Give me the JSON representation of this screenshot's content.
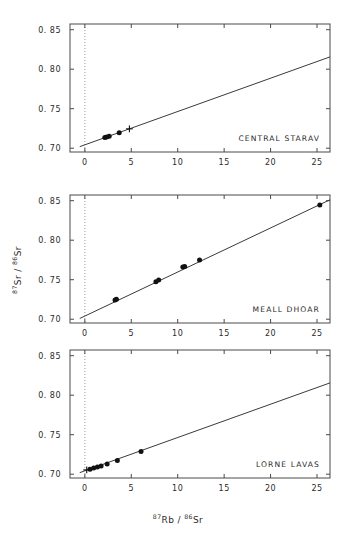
{
  "figure": {
    "axis_labels": {
      "x_sup1": "87",
      "x_base1": "Rb",
      "x_sep": " / ",
      "x_sup2": "86",
      "x_base2": "Sr",
      "y_sup1": "87",
      "y_base1": "Sr",
      "y_sep": " / ",
      "y_sup2": "86",
      "y_base2": "Sr"
    },
    "colors": {
      "frame": "#4a4a4a",
      "marker": "#111111",
      "line": "#3a3a3a",
      "reference_dotted": "#9a9a9a",
      "text": "#2b2b2b",
      "background": "#ffffff"
    }
  },
  "chart_data": [
    {
      "type": "scatter",
      "title": "CENTRAL STARAV",
      "xlabel": "87Rb / 86Sr",
      "ylabel": "87Sr / 86Sr",
      "xlim": [
        -1.6,
        26.4
      ],
      "ylim": [
        0.6952,
        0.8572
      ],
      "xticks": [
        0,
        5,
        10,
        15,
        20,
        25
      ],
      "yticks": [
        0.7,
        0.75,
        0.8,
        0.85
      ],
      "xtick_labels": [
        "0",
        "5",
        "10",
        "15",
        "20",
        "25"
      ],
      "ytick_labels": [
        "0. 70",
        "0. 75",
        "0. 80",
        "0. 85"
      ],
      "grid": false,
      "legend": "none",
      "reference_line_x": 0,
      "points": [
        {
          "x": 2.15,
          "y": 0.7137,
          "marker": "filled-circle"
        },
        {
          "x": 2.35,
          "y": 0.7142,
          "marker": "filled-circle"
        },
        {
          "x": 2.62,
          "y": 0.7152,
          "marker": "filled-circle"
        },
        {
          "x": 3.7,
          "y": 0.7196,
          "marker": "filled-circle"
        },
        {
          "x": 4.8,
          "y": 0.7245,
          "marker": "cross"
        }
      ],
      "fit_line": {
        "intercept": 0.7043,
        "slope": 0.004215,
        "x_from": -0.55,
        "x_to": 26.4
      }
    },
    {
      "type": "scatter",
      "title": "MEALL DHOAR",
      "xlabel": "87Rb / 86Sr",
      "ylabel": "87Sr / 86Sr",
      "xlim": [
        -1.6,
        26.4
      ],
      "ylim": [
        0.6952,
        0.8572
      ],
      "xticks": [
        0,
        5,
        10,
        15,
        20,
        25
      ],
      "yticks": [
        0.7,
        0.75,
        0.8,
        0.85
      ],
      "xtick_labels": [
        "0",
        "5",
        "10",
        "15",
        "20",
        "25"
      ],
      "ytick_labels": [
        "0. 70",
        "0. 75",
        "0. 80",
        "0. 85"
      ],
      "grid": false,
      "legend": "none",
      "reference_line_x": 0,
      "points": [
        {
          "x": 3.25,
          "y": 0.7243,
          "marker": "filled-circle"
        },
        {
          "x": 3.4,
          "y": 0.7252,
          "marker": "filled-circle"
        },
        {
          "x": 7.65,
          "y": 0.7473,
          "marker": "filled-circle"
        },
        {
          "x": 7.95,
          "y": 0.7497,
          "marker": "filled-circle"
        },
        {
          "x": 10.55,
          "y": 0.766,
          "marker": "filled-circle"
        },
        {
          "x": 10.75,
          "y": 0.7668,
          "marker": "filled-circle"
        },
        {
          "x": 12.35,
          "y": 0.7748,
          "marker": "filled-circle"
        },
        {
          "x": 25.3,
          "y": 0.8447,
          "marker": "filled-circle"
        }
      ],
      "fit_line": {
        "intercept": 0.704,
        "slope": 0.005575,
        "x_from": -0.55,
        "x_to": 26.4
      }
    },
    {
      "type": "scatter",
      "title": "LORNE LAVAS",
      "xlabel": "87Rb / 86Sr",
      "ylabel": "87Sr / 86Sr",
      "xlim": [
        -1.6,
        26.4
      ],
      "ylim": [
        0.6952,
        0.8572
      ],
      "xticks": [
        0,
        5,
        10,
        15,
        20,
        25
      ],
      "yticks": [
        0.7,
        0.75,
        0.8,
        0.85
      ],
      "xtick_labels": [
        "0",
        "5",
        "10",
        "15",
        "20",
        "25"
      ],
      "ytick_labels": [
        "0. 70",
        "0. 75",
        "0. 80",
        "0. 85"
      ],
      "grid": false,
      "legend": "none",
      "reference_line_x": 0,
      "points": [
        {
          "x": 0.2,
          "y": 0.7055,
          "marker": "cross"
        },
        {
          "x": 0.55,
          "y": 0.7062,
          "marker": "filled-circle"
        },
        {
          "x": 0.95,
          "y": 0.7078,
          "marker": "filled-circle"
        },
        {
          "x": 1.35,
          "y": 0.7092,
          "marker": "filled-circle"
        },
        {
          "x": 1.75,
          "y": 0.7103,
          "marker": "filled-circle"
        },
        {
          "x": 2.4,
          "y": 0.7128,
          "marker": "filled-circle"
        },
        {
          "x": 3.5,
          "y": 0.7175,
          "marker": "filled-circle"
        },
        {
          "x": 6.05,
          "y": 0.7288,
          "marker": "filled-circle"
        }
      ],
      "fit_line": {
        "intercept": 0.7043,
        "slope": 0.004215,
        "x_from": -0.55,
        "x_to": 26.4
      }
    }
  ]
}
